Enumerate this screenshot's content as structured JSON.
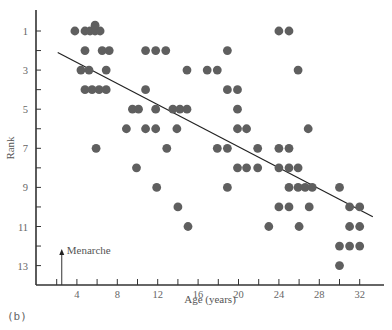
{
  "chart_data": {
    "type": "scatter",
    "title": "",
    "xlabel": "Age (years)",
    "ylabel": "Rank",
    "xlim": [
      0,
      34.5
    ],
    "ylim": [
      14,
      0.3
    ],
    "y_inverted": true,
    "x_ticks": [
      2,
      4,
      6,
      8,
      10,
      12,
      14,
      16,
      18,
      20,
      22,
      24,
      26,
      28,
      30,
      32
    ],
    "x_tick_labels": [
      "4",
      "8",
      "12",
      "16",
      "20",
      "24",
      "28",
      "32"
    ],
    "x_tick_label_values": [
      4,
      8,
      12,
      16,
      20,
      24,
      28,
      32
    ],
    "y_ticks": [
      1,
      2,
      3,
      4,
      5,
      6,
      7,
      8,
      9,
      10,
      11,
      12,
      13
    ],
    "y_tick_labels": [
      "1",
      "3",
      "5",
      "7",
      "9",
      "11",
      "13"
    ],
    "y_tick_label_values": [
      1,
      3,
      5,
      7,
      9,
      11,
      13
    ],
    "grid": false,
    "legend": null,
    "marker_color": "#5f5f5f",
    "points": [
      {
        "x": 3.8,
        "y": 1
      },
      {
        "x": 4.8,
        "y": 1
      },
      {
        "x": 5.3,
        "y": 1
      },
      {
        "x": 5.8,
        "y": 1
      },
      {
        "x": 6.3,
        "y": 1
      },
      {
        "x": 5.8,
        "y": 0.7
      },
      {
        "x": 24,
        "y": 1
      },
      {
        "x": 25,
        "y": 1
      },
      {
        "x": 4.8,
        "y": 2
      },
      {
        "x": 6.5,
        "y": 2
      },
      {
        "x": 7.2,
        "y": 2
      },
      {
        "x": 10.8,
        "y": 2
      },
      {
        "x": 11.8,
        "y": 2
      },
      {
        "x": 12.8,
        "y": 2
      },
      {
        "x": 18.9,
        "y": 2
      },
      {
        "x": 4.4,
        "y": 3
      },
      {
        "x": 5.2,
        "y": 3
      },
      {
        "x": 6.9,
        "y": 3
      },
      {
        "x": 14.9,
        "y": 3
      },
      {
        "x": 16.9,
        "y": 3
      },
      {
        "x": 17.9,
        "y": 3
      },
      {
        "x": 25.9,
        "y": 3
      },
      {
        "x": 4.8,
        "y": 4
      },
      {
        "x": 5.5,
        "y": 4
      },
      {
        "x": 6.2,
        "y": 4
      },
      {
        "x": 6.9,
        "y": 4
      },
      {
        "x": 10.8,
        "y": 4
      },
      {
        "x": 18.9,
        "y": 4
      },
      {
        "x": 19.9,
        "y": 4
      },
      {
        "x": 9.5,
        "y": 5
      },
      {
        "x": 10.1,
        "y": 5
      },
      {
        "x": 11.8,
        "y": 5
      },
      {
        "x": 13.5,
        "y": 5
      },
      {
        "x": 14.2,
        "y": 5
      },
      {
        "x": 14.9,
        "y": 5
      },
      {
        "x": 19.9,
        "y": 5
      },
      {
        "x": 8.9,
        "y": 6
      },
      {
        "x": 10.8,
        "y": 6
      },
      {
        "x": 11.8,
        "y": 6
      },
      {
        "x": 13.9,
        "y": 6
      },
      {
        "x": 19.9,
        "y": 6
      },
      {
        "x": 20.8,
        "y": 6
      },
      {
        "x": 26.9,
        "y": 6
      },
      {
        "x": 5.9,
        "y": 7
      },
      {
        "x": 12.9,
        "y": 7
      },
      {
        "x": 17.9,
        "y": 7
      },
      {
        "x": 18.9,
        "y": 7
      },
      {
        "x": 21.9,
        "y": 7
      },
      {
        "x": 24,
        "y": 7
      },
      {
        "x": 25,
        "y": 7
      },
      {
        "x": 9.9,
        "y": 8
      },
      {
        "x": 19.9,
        "y": 8
      },
      {
        "x": 20.8,
        "y": 8
      },
      {
        "x": 21.9,
        "y": 8
      },
      {
        "x": 24,
        "y": 8
      },
      {
        "x": 25,
        "y": 8
      },
      {
        "x": 25.9,
        "y": 8
      },
      {
        "x": 11.9,
        "y": 9
      },
      {
        "x": 18.9,
        "y": 9
      },
      {
        "x": 25,
        "y": 9
      },
      {
        "x": 25.9,
        "y": 9
      },
      {
        "x": 26.6,
        "y": 9
      },
      {
        "x": 27.3,
        "y": 9
      },
      {
        "x": 30,
        "y": 9
      },
      {
        "x": 14,
        "y": 10
      },
      {
        "x": 24,
        "y": 10
      },
      {
        "x": 25,
        "y": 10
      },
      {
        "x": 27,
        "y": 10
      },
      {
        "x": 31,
        "y": 10
      },
      {
        "x": 32,
        "y": 10
      },
      {
        "x": 15,
        "y": 11
      },
      {
        "x": 23,
        "y": 11
      },
      {
        "x": 26,
        "y": 11
      },
      {
        "x": 31,
        "y": 11
      },
      {
        "x": 32,
        "y": 11
      },
      {
        "x": 30,
        "y": 12
      },
      {
        "x": 31,
        "y": 12
      },
      {
        "x": 32,
        "y": 12
      },
      {
        "x": 30,
        "y": 13
      }
    ],
    "regression_line": {
      "x1": 2.1,
      "y1": 2.1,
      "x2": 33.3,
      "y2": 10.5
    },
    "annotations": [
      {
        "text": "Menarche",
        "x": 2.5,
        "y_from": 14,
        "y_to": 12.2,
        "arrow": "up"
      }
    ],
    "panel_label": "(b)"
  }
}
